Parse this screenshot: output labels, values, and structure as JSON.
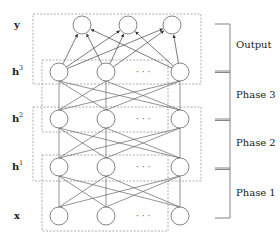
{
  "diagram": {
    "layer_labels": [
      {
        "id": "y",
        "text": "y",
        "sup": "",
        "y": 28
      },
      {
        "id": "h3",
        "text": "h",
        "sup": "3",
        "y": 75
      },
      {
        "id": "h2",
        "text": "h",
        "sup": "2",
        "y": 122
      },
      {
        "id": "h1",
        "text": "h",
        "sup": "1",
        "y": 170
      },
      {
        "id": "x",
        "text": "x",
        "sup": "",
        "y": 219
      }
    ],
    "ellipsis": "· · ·",
    "phases": [
      {
        "label": "Output",
        "y": 46
      },
      {
        "label": "Phase 3",
        "y": 96
      },
      {
        "label": "Phase 2",
        "y": 144
      },
      {
        "label": "Phase 1",
        "y": 194
      }
    ],
    "colors": {
      "stroke": "#666666",
      "dashed_box": "#999999",
      "bracket": "#777777",
      "text": "#222222"
    }
  }
}
